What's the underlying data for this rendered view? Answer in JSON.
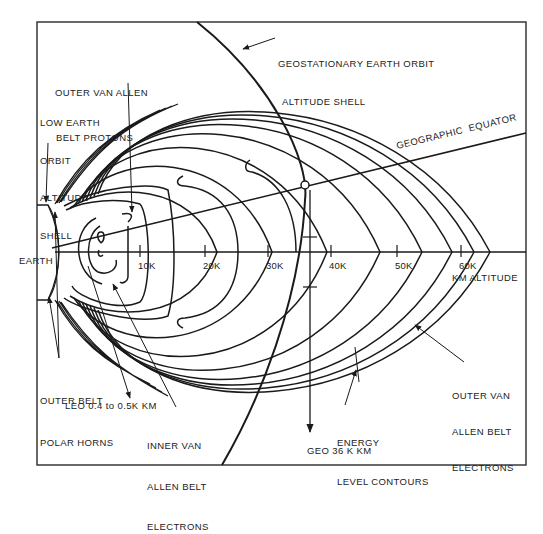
{
  "diagram": {
    "line_color": "#1a1a1a",
    "background": "#ffffff",
    "labels": {
      "geo_shell": [
        "GEOSTATIONARY EARTH ORBIT",
        "ALTITUDE SHELL"
      ],
      "outer_protons": [
        "OUTER VAN ALLEN",
        "BELT PROTONS"
      ],
      "leo_shell": [
        "LOW EARTH",
        "ORBIT",
        "ALTITUDE",
        "SHELL"
      ],
      "equator": "GEOGRAPHIC  EQUATOR",
      "earth": "EARTH",
      "polar_horns": [
        "OUTER BELT",
        "POLAR HORNS"
      ],
      "leo_range": "LEO 0.4 to 0.5K KM",
      "inner_electrons": [
        "INNER VAN",
        "ALLEN BELT",
        "ELECTRONS"
      ],
      "geo_altitude": "GEO 36 K KM",
      "energy_contours": [
        "ENERGY",
        "LEVEL CONTOURS"
      ],
      "outer_electrons": [
        "OUTER VAN",
        "ALLEN BELT",
        "ELECTRONS"
      ],
      "axis_unit": "KM ALTITUDE"
    },
    "axis": {
      "ticks": [
        "10K",
        "20K",
        "30K",
        "40K",
        "50K",
        "60K"
      ],
      "tick_values_km": [
        10000,
        20000,
        30000,
        40000,
        50000,
        60000
      ],
      "geo_altitude_km": 36000
    }
  }
}
